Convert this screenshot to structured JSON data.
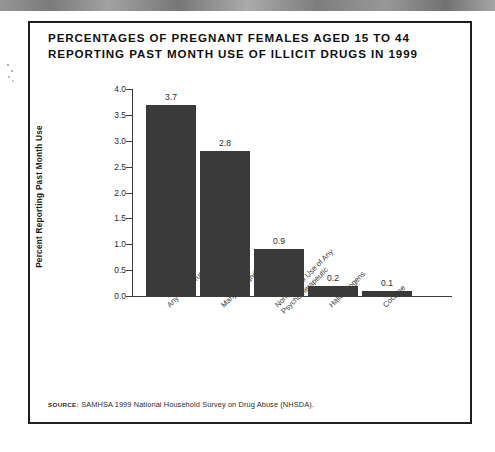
{
  "figure": {
    "title_lines": [
      "PERCENTAGES OF PREGNANT FEMALES AGED 15 TO 44",
      "REPORTING PAST MONTH USE OF ILLICIT DRUGS IN 1999"
    ],
    "source_kicker": "SOURCE:",
    "source_text": "SAMHSA 1999 National Household Survey on Drug Abuse (NHSDA).",
    "bar_color": "#3a3a3a",
    "frame_color": "#1f1f1f",
    "axis_color": "#3b3b3b"
  },
  "chart_data": {
    "type": "bar",
    "title": "PERCENTAGES OF PREGNANT FEMALES AGED 15 TO 44 REPORTING PAST MONTH USE OF ILLICIT DRUGS IN 1999",
    "xlabel": "",
    "ylabel": "Percent Reporting Past Month Use",
    "ylim": [
      0.0,
      4.0
    ],
    "ytick_step": 0.5,
    "ytick_labels": [
      "0.0",
      "0.5",
      "1.0",
      "1.5",
      "2.0",
      "2.5",
      "3.0",
      "3.5",
      "4.0"
    ],
    "grid": false,
    "legend": "none",
    "categories": [
      "Any Illicit Drug",
      "Marijuana and Hashish",
      "Nonmedical Use of Any Psychotherapeutic",
      "Hallucinogens",
      "Cocaine"
    ],
    "category_lines": [
      [
        "Any Illicit Drug"
      ],
      [
        "Marijuana and Hashish"
      ],
      [
        "Nonmedical Use of Any",
        "Psychotherapeutic"
      ],
      [
        "Hallucinogens"
      ],
      [
        "Cocaine"
      ]
    ],
    "values": [
      3.7,
      2.8,
      0.9,
      0.2,
      0.1
    ],
    "value_labels": [
      "3.7",
      "2.8",
      "0.9",
      "0.2",
      "0.1"
    ]
  }
}
